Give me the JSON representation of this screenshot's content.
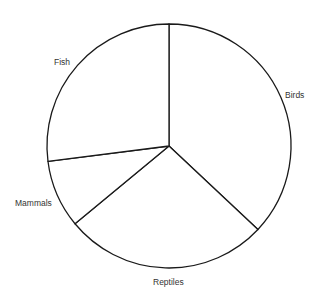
{
  "chart_data": {
    "type": "pie",
    "title": "",
    "categories": [
      "Birds",
      "Reptiles",
      "Mammals",
      "Fish"
    ],
    "values": [
      37,
      27,
      9,
      27
    ],
    "start_angle_deg": 0,
    "direction": "clockwise",
    "colors": [
      "#ffffff",
      "#ffffff",
      "#ffffff",
      "#ffffff"
    ],
    "stroke_color": "#1a1a1a",
    "legend": "none",
    "labels_outside": true
  },
  "labels": {
    "birds": "Birds",
    "reptiles": "Reptiles",
    "mammals": "Mammals",
    "fish": "Fish"
  }
}
